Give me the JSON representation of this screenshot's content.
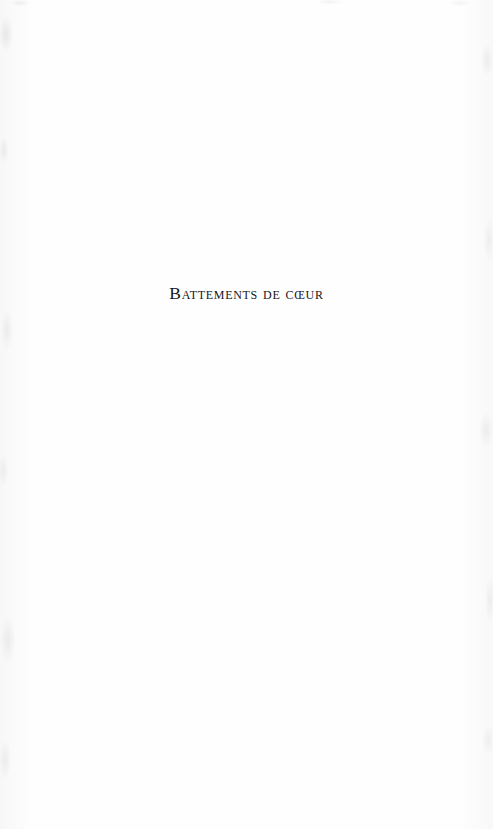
{
  "page": {
    "kind": "book-half-title-page",
    "background_color": "#fefefe",
    "ink_color": "#16161c"
  },
  "content": {
    "half_title": "Battements de cœur"
  }
}
